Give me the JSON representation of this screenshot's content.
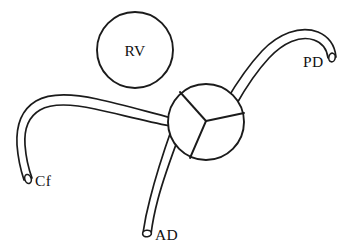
{
  "figure": {
    "title": "RV",
    "background_color": "#ffffff",
    "line_color": "#1b1b1b",
    "label_color": "#111111",
    "type": "anatomical-line-diagram"
  },
  "labels": {
    "rv": "RV",
    "pd": "PD",
    "cf": "Cf",
    "ad": "AD"
  },
  "structures": [
    {
      "id": "rv-chamber",
      "name": "RV",
      "shape": "circle",
      "cx": 135,
      "cy": 50,
      "r": 38
    },
    {
      "id": "central-hub",
      "name": "central junction",
      "shape": "circle",
      "cx": 206,
      "cy": 122,
      "r": 38,
      "internal_dividers": 3
    },
    {
      "id": "pd-branch",
      "name": "PD",
      "shape": "tube",
      "label_position": "right",
      "tip_x": 335,
      "tip_y": 62
    },
    {
      "id": "cf-branch",
      "name": "Cf",
      "shape": "tube",
      "label_position": "lower-left",
      "tip_x": 30,
      "tip_y": 180
    },
    {
      "id": "ad-branch",
      "name": "AD",
      "shape": "tube",
      "label_position": "bottom",
      "tip_x": 145,
      "tip_y": 235
    }
  ],
  "label_positions": {
    "rv": {
      "x": 135,
      "y": 55
    },
    "pd": {
      "x": 305,
      "y": 66
    },
    "cf": {
      "x": 40,
      "y": 186
    },
    "ad": {
      "x": 155,
      "y": 239
    }
  }
}
